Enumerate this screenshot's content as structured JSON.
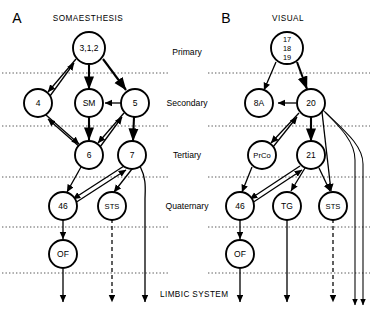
{
  "figure": {
    "type": "neuroanatomical-connectivity-diagram",
    "bottom_label": "LIMBIC SYSTEM"
  },
  "tiers": [
    {
      "name": "primary",
      "label": "Primary"
    },
    {
      "name": "secondary",
      "label": "Secondary"
    },
    {
      "name": "tertiary",
      "label": "Tertiary"
    },
    {
      "name": "quaternary",
      "label": "Quaternary"
    }
  ],
  "panels": [
    {
      "letter": "A",
      "title": "SOMAESTHESIS",
      "nodes": [
        {
          "id": "a-312",
          "label": "3,1,2",
          "tier": "primary"
        },
        {
          "id": "a-4",
          "label": "4",
          "tier": "secondary"
        },
        {
          "id": "a-sm",
          "label": "SM",
          "tier": "secondary"
        },
        {
          "id": "a-5",
          "label": "5",
          "tier": "secondary"
        },
        {
          "id": "a-6",
          "label": "6",
          "tier": "tertiary"
        },
        {
          "id": "a-7",
          "label": "7",
          "tier": "tertiary"
        },
        {
          "id": "a-46",
          "label": "46",
          "tier": "quaternary"
        },
        {
          "id": "a-sts",
          "label": "STS",
          "tier": "quaternary"
        },
        {
          "id": "a-of",
          "label": "OF",
          "tier": "limbic"
        }
      ]
    },
    {
      "letter": "B",
      "title": "VISUAL",
      "nodes": [
        {
          "id": "b-171819",
          "label": "17 18 19",
          "lines": [
            "17",
            "18",
            "19"
          ],
          "tier": "primary"
        },
        {
          "id": "b-8a",
          "label": "8A",
          "tier": "secondary"
        },
        {
          "id": "b-20",
          "label": "20",
          "tier": "secondary"
        },
        {
          "id": "b-prco",
          "label": "PrCo",
          "tier": "tertiary"
        },
        {
          "id": "b-21",
          "label": "21",
          "tier": "tertiary"
        },
        {
          "id": "b-46",
          "label": "46",
          "tier": "quaternary"
        },
        {
          "id": "b-tg",
          "label": "TG",
          "tier": "quaternary"
        },
        {
          "id": "b-sts",
          "label": "STS",
          "tier": "quaternary"
        },
        {
          "id": "b-of",
          "label": "OF",
          "tier": "limbic"
        }
      ]
    }
  ],
  "colors": {
    "stroke": "#000000",
    "node_fill": "#ffffff",
    "divider": "#444444",
    "background": "#ffffff"
  }
}
